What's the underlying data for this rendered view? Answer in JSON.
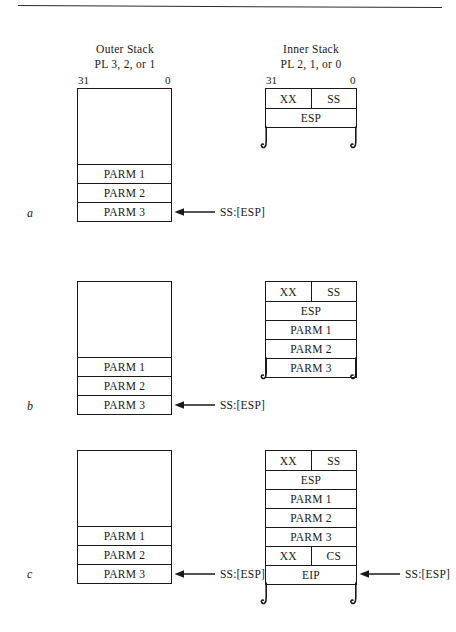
{
  "figure": {
    "columns": [
      {
        "title_line1": "Outer Stack",
        "title_line2": "PL 3, 2, or 1"
      },
      {
        "title_line1": "Inner Stack",
        "title_line2": "PL 2, 1, or 0"
      }
    ],
    "bit_labels": {
      "high": "31",
      "low": "0"
    },
    "pointer_label": "SS:[ESP]",
    "panels": [
      {
        "letter": "a",
        "outer_stack": {
          "empty_region": "",
          "cells": [
            "PARM 1",
            "PARM 2",
            "PARM 3"
          ],
          "pointer_target": "PARM 3",
          "pointer_label": "SS:[ESP]"
        },
        "inner_stack": {
          "split_cell": {
            "left": "XX",
            "right": "SS"
          },
          "cells": [
            "ESP"
          ],
          "torn_edge": true
        }
      },
      {
        "letter": "b",
        "outer_stack": {
          "empty_region": "",
          "cells": [
            "PARM 1",
            "PARM 2",
            "PARM 3"
          ],
          "pointer_target": "PARM 3",
          "pointer_label": "SS:[ESP]"
        },
        "inner_stack": {
          "split_cell": {
            "left": "XX",
            "right": "SS"
          },
          "cells": [
            "ESP",
            "PARM 1",
            "PARM 2",
            "PARM 3"
          ],
          "torn_edge": true
        }
      },
      {
        "letter": "c",
        "outer_stack": {
          "empty_region": "",
          "cells": [
            "PARM 1",
            "PARM 2",
            "PARM 3"
          ],
          "pointer_target": "PARM 3",
          "pointer_label": "SS:[ESP]"
        },
        "inner_stack": {
          "split_cell": {
            "left": "XX",
            "right": "SS"
          },
          "cells": [
            "ESP",
            "PARM 1",
            "PARM 2",
            "PARM 3"
          ],
          "split_cell_2": {
            "left": "XX",
            "right": "CS"
          },
          "final_cell": "EIP",
          "pointer_target": "EIP",
          "pointer_label": "SS:[ESP]",
          "torn_edge": true
        }
      }
    ],
    "colors": {
      "ink": "#1a1a1a",
      "paper": "#ffffff"
    }
  }
}
